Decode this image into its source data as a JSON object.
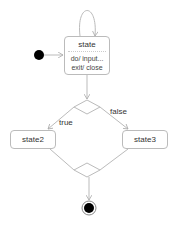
{
  "diagram": {
    "type": "uml-state-machine",
    "colors": {
      "line": "#bbbbbb",
      "text": "#333333",
      "node_fill": "#000000"
    },
    "initial_node": {
      "x": 39,
      "y": 55
    },
    "states": [
      {
        "id": "state",
        "name": "state",
        "actions": [
          "do/ input...",
          "exit/ close"
        ],
        "x": 64,
        "y": 36,
        "w": 46,
        "h": 39
      },
      {
        "id": "state2",
        "name": "state2",
        "actions": [],
        "x": 10,
        "y": 130,
        "w": 46,
        "h": 19
      },
      {
        "id": "state3",
        "name": "state3",
        "actions": [],
        "x": 122,
        "y": 130,
        "w": 46,
        "h": 19
      }
    ],
    "decision": {
      "x": 87,
      "y": 107
    },
    "merge": {
      "x": 87,
      "y": 170
    },
    "final_node": {
      "x": 89,
      "y": 208
    },
    "transitions": [
      {
        "from": "initial",
        "to": "state",
        "label": ""
      },
      {
        "from": "state",
        "to": "state",
        "label": ""
      },
      {
        "from": "state",
        "to": "decision",
        "label": ""
      },
      {
        "from": "decision",
        "to": "state2",
        "label": "true"
      },
      {
        "from": "decision",
        "to": "state3",
        "label": "false"
      },
      {
        "from": "state2",
        "to": "merge",
        "label": ""
      },
      {
        "from": "state3",
        "to": "merge",
        "label": ""
      },
      {
        "from": "merge",
        "to": "final",
        "label": ""
      }
    ],
    "labels": {
      "true": "true",
      "false": "false"
    }
  }
}
